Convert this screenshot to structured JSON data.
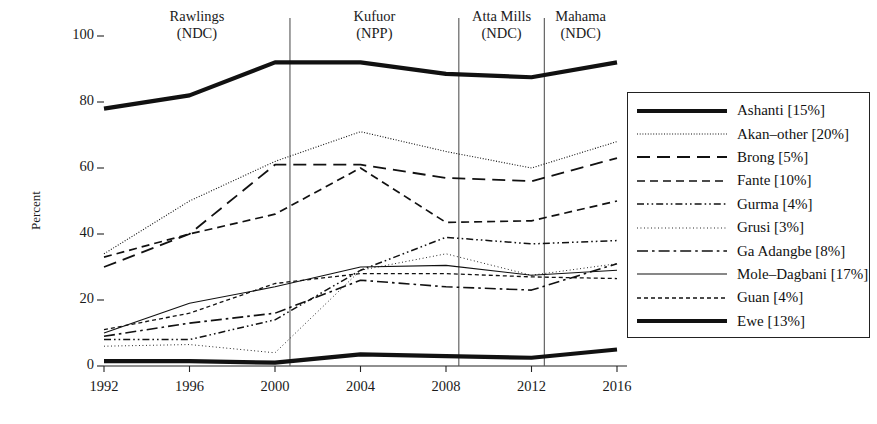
{
  "chart_data": {
    "type": "line",
    "title": "",
    "xlabel": "",
    "ylabel": "Percent",
    "x": [
      1992,
      1996,
      2000,
      2004,
      2008,
      2012,
      2016
    ],
    "xticklabels": [
      "1992",
      "1996",
      "2000",
      "2004",
      "2008",
      "2012",
      "2016"
    ],
    "yticklabels": [
      "0",
      "20",
      "40",
      "60",
      "80",
      "100"
    ],
    "yticks": [
      0,
      20,
      40,
      60,
      80,
      100
    ],
    "ylim": [
      0,
      100
    ],
    "xlim": [
      1992,
      2016
    ],
    "grid": false,
    "legend_position": "right-outside",
    "series": [
      {
        "name": "Ashanti [15%]",
        "label": "Ashanti",
        "share": "15%",
        "style": "thick-solid",
        "values": [
          78,
          82,
          92,
          92,
          88.5,
          87.5,
          92
        ]
      },
      {
        "name": "Akan-other [20%]",
        "label": "Akan–other",
        "share": "20%",
        "style": "fine-dotted",
        "values": [
          34,
          50,
          62,
          71,
          65,
          60,
          68
        ]
      },
      {
        "name": "Brong [5%]",
        "label": "Brong",
        "share": "5%",
        "style": "long-dash",
        "values": [
          30,
          40,
          61,
          61,
          57,
          56,
          63
        ]
      },
      {
        "name": "Fante [10%]",
        "label": "Fante",
        "share": "10%",
        "style": "dash",
        "values": [
          33,
          40,
          46,
          60,
          43.5,
          44,
          50
        ]
      },
      {
        "name": "Gurma [4%]",
        "label": "Gurma",
        "share": "4%",
        "style": "dash-dot-dot",
        "values": [
          8,
          8,
          14,
          29,
          39,
          37,
          38
        ]
      },
      {
        "name": "Grusi [3%]",
        "label": "Grusi",
        "share": "3%",
        "style": "dotted",
        "values": [
          6,
          6.5,
          4,
          29,
          34,
          27.5,
          31
        ]
      },
      {
        "name": "Ga Adangbe [8%]",
        "label": "Ga Adangbe",
        "share": "8%",
        "style": "dash-dot",
        "values": [
          9,
          13,
          16,
          26,
          24,
          23,
          31
        ]
      },
      {
        "name": "Mole-Dagbani [17%]",
        "label": "Mole–Dagbani",
        "share": "17%",
        "style": "thin-solid",
        "values": [
          10,
          19,
          24,
          30,
          30.5,
          27.5,
          29
        ]
      },
      {
        "name": "Guan [4%]",
        "label": "Guan",
        "share": "4%",
        "style": "short-dash",
        "values": [
          11,
          16,
          25,
          28,
          28,
          27,
          26.5
        ]
      },
      {
        "name": "Ewe [13%]",
        "label": "Ewe",
        "share": "13%",
        "style": "thick-solid",
        "values": [
          1.5,
          1.5,
          1,
          3.5,
          3,
          2.5,
          5
        ]
      }
    ],
    "annotations": [
      {
        "name": "era-rawlings",
        "line1": "Rawlings",
        "line2": "(NDC)",
        "x_center": 1992.0,
        "span_start": 1992,
        "span_end": 2000.7
      },
      {
        "name": "era-kufuor",
        "line1": "Kufuor",
        "line2": "(NPP)",
        "x_center": 2004.0,
        "span_start": 2000.7,
        "span_end": 2008.6
      },
      {
        "name": "era-atta-mills",
        "line1": "Atta Mills",
        "line2": "(NDC)",
        "x_center": 2010.5,
        "span_start": 2008.6,
        "span_end": 2012.6
      },
      {
        "name": "era-mahama",
        "line1": "Mahama",
        "line2": "(NDC)",
        "x_center": 2014.5,
        "span_start": 2012.6,
        "span_end": 2016
      }
    ],
    "dividers": [
      2000.7,
      2008.6,
      2012.6
    ]
  },
  "legend": {
    "items": [
      {
        "text": "Ashanti [15%]"
      },
      {
        "text": "Akan–other [20%]"
      },
      {
        "text": "Brong [5%]"
      },
      {
        "text": "Fante [10%]"
      },
      {
        "text": "Gurma [4%]"
      },
      {
        "text": "Grusi [3%]"
      },
      {
        "text": "Ga Adangbe [8%]"
      },
      {
        "text": "Mole–Dagbani [17%]"
      },
      {
        "text": "Guan [4%]"
      },
      {
        "text": "Ewe [13%]"
      }
    ]
  },
  "axes": {
    "ylabel": "Percent"
  },
  "colors": {
    "ink": "#111111",
    "axis": "#222222",
    "divider": "#555555",
    "background": "#ffffff"
  }
}
